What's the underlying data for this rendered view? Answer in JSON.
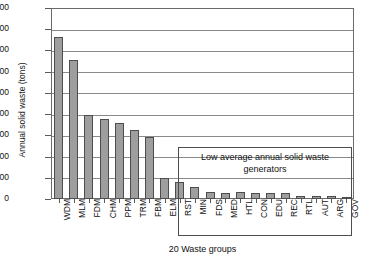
{
  "chart_data": {
    "type": "bar",
    "title": "",
    "xlabel": "20 Waste groups",
    "ylabel": "Annual solid waste (tons)",
    "ylim": [
      0,
      1800
    ],
    "ytick_step": 200,
    "yticks": [
      1800,
      1600,
      1400,
      1200,
      1000,
      800,
      600,
      400,
      200,
      0
    ],
    "grid": true,
    "legend": "none",
    "categories": [
      "WDM",
      "MLM",
      "FDM",
      "CHM",
      "PPM",
      "TRM",
      "FBM",
      "ELM",
      "RST",
      "MIN",
      "FDS",
      "MED",
      "HTL",
      "CON",
      "EDU",
      "REC",
      "RTL",
      "AUT",
      "ARG",
      "GOV"
    ],
    "values": [
      1530,
      1310,
      790,
      750,
      720,
      650,
      580,
      200,
      160,
      110,
      70,
      60,
      65,
      60,
      55,
      55,
      30,
      25,
      25,
      10
    ],
    "annotations": [
      {
        "text": "Low average annual solid waste generators",
        "covers": [
          "RST",
          "MIN",
          "FDS",
          "MED",
          "HTL",
          "CON",
          "EDU",
          "REC",
          "RTL",
          "AUT",
          "ARG",
          "GOV"
        ]
      }
    ],
    "bar_color": "#9e9e9e",
    "bar_edge_color": "#4d4d4d"
  }
}
